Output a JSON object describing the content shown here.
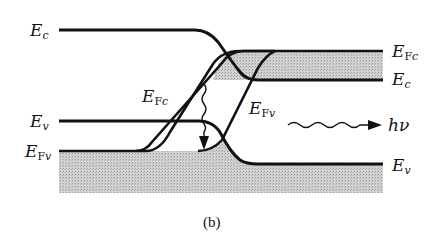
{
  "figure": {
    "caption": "(b)",
    "labels": {
      "left_ec": {
        "main": "E",
        "sub": "c"
      },
      "left_ev": {
        "main": "E",
        "sub": "v"
      },
      "left_efv": {
        "main": "E",
        "sub_upright": "F",
        "sub": "v"
      },
      "center_efc": {
        "main": "E",
        "sub_upright": "F",
        "sub": "c"
      },
      "center_efv": {
        "main": "E",
        "sub_upright": "F",
        "sub": "v"
      },
      "right_efc": {
        "main": "E",
        "sub_upright": "F",
        "sub": "c"
      },
      "right_ec": {
        "main": "E",
        "sub": "c"
      },
      "right_ev": {
        "main": "E",
        "sub": "v"
      },
      "photon": "hν"
    },
    "colors": {
      "line": "#111111",
      "shading": "#c8c8c8",
      "background": "#ffffff"
    }
  }
}
